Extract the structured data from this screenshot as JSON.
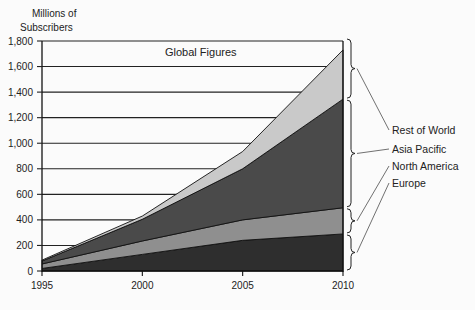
{
  "chart_data": {
    "type": "area",
    "stacked": true,
    "title": "Global Figures",
    "ylabel": "Millions of Subscribers",
    "xlabel": "",
    "x": [
      1995,
      2000,
      2005,
      2010
    ],
    "x_tick_labels": [
      "1995",
      "2000",
      "2005",
      "2010"
    ],
    "y_tick_labels": [
      "0",
      "200",
      "400",
      "600",
      "800",
      "1,000",
      "1,200",
      "1,400",
      "1,600",
      "1,800"
    ],
    "ylim": [
      0,
      1800
    ],
    "grid": "horizontal",
    "series": [
      {
        "name": "Europe",
        "values": [
          20,
          130,
          240,
          290
        ],
        "color": "#2e2e2e"
      },
      {
        "name": "North America",
        "values": [
          35,
          105,
          160,
          205
        ],
        "color": "#8f8f8f"
      },
      {
        "name": "Asia Pacific",
        "values": [
          23,
          170,
          400,
          850
        ],
        "color": "#4a4a4a"
      },
      {
        "name": "Rest of World",
        "values": [
          7,
          25,
          135,
          385
        ],
        "color": "#c9c9c9"
      }
    ],
    "legend_position": "right (bracketed labels)",
    "legend": [
      "Rest of World",
      "Asia Pacific",
      "North America",
      "Europe"
    ]
  },
  "labels": {
    "ylabel_line1": "Millions of",
    "ylabel_line2": "Subscribers",
    "title": "Global Figures",
    "legend": [
      "Rest of World",
      "Asia Pacific",
      "North America",
      "Europe"
    ]
  }
}
